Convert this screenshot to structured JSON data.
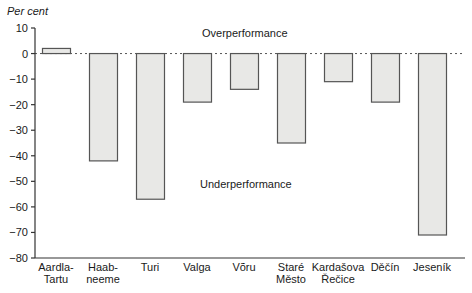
{
  "chart_data": {
    "type": "bar",
    "title": "",
    "ylabel": "Per cent",
    "xlabel": "",
    "ylim": [
      -80,
      10
    ],
    "yticks": [
      10,
      0,
      -10,
      -20,
      -30,
      -40,
      -50,
      -60,
      -70,
      -80
    ],
    "ytick_labels": [
      "10",
      "0",
      "−10",
      "−20",
      "−30",
      "−40",
      "−50",
      "−60",
      "−70",
      "−80"
    ],
    "categories": [
      "Aardla-Tartu",
      "Haabneeme",
      "Turi",
      "Valga",
      "Võru",
      "Staré Město",
      "Kardašova Řečice",
      "Děčín",
      "Jeseník"
    ],
    "category_label_lines": [
      [
        "Aardla-",
        "Tartu"
      ],
      [
        "Haab-",
        "neeme"
      ],
      [
        "Turi"
      ],
      [
        "Valga"
      ],
      [
        "Võru"
      ],
      [
        "Staré",
        "Město"
      ],
      [
        "Kardašova",
        "Řečice"
      ],
      [
        "Děčín"
      ],
      [
        "Jeseník"
      ]
    ],
    "values": [
      2,
      -42,
      -57,
      -19,
      -14,
      -35,
      -11,
      -19,
      -71
    ],
    "annotations": [
      {
        "text": "Overperformance",
        "region": "above zero"
      },
      {
        "text": "Underperformance",
        "region": "below zero"
      }
    ],
    "reference_line": {
      "y": 0,
      "style": "dashed"
    },
    "grid": false,
    "legend": null,
    "bar_fill": "#e8e8e6",
    "bar_edge": "#555555"
  },
  "labels": {
    "unit": "Per cent",
    "over": "Overperformance",
    "under": "Underperformance"
  }
}
